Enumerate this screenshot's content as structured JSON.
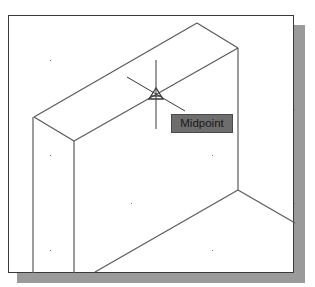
{
  "viewport": {
    "snap_tooltip": "Midpoint",
    "snap_marker": "midpoint-triangle",
    "cursor": "crosshair"
  },
  "colors": {
    "background": "#ffffff",
    "lines": "#555555",
    "frame": "#3a3a3a",
    "shadow": "#9a9a9a",
    "tooltip_bg": "#6d6d6d"
  }
}
